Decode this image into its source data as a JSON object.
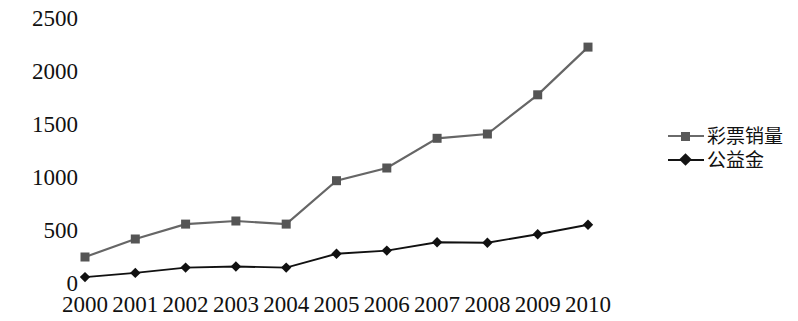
{
  "chart_data": {
    "type": "line",
    "title": "",
    "subtitle": "",
    "xlabel": "",
    "ylabel": "",
    "grid": false,
    "legend_position": "right",
    "categories": [
      "2000",
      "2001",
      "2002",
      "2003",
      "2004",
      "2005",
      "2006",
      "2007",
      "2008",
      "2009",
      "2010"
    ],
    "ylim": [
      0,
      2500
    ],
    "yticks": [
      0,
      500,
      1000,
      1500,
      2000,
      2500
    ],
    "ytick_labels": [
      "0",
      "500",
      "1000",
      "1500",
      "2000",
      "2500"
    ],
    "series": [
      {
        "name": "彩票销量",
        "marker": "square",
        "color": "#555555",
        "line_color": "#666666",
        "values": [
          250,
          420,
          560,
          590,
          560,
          970,
          1090,
          1370,
          1410,
          1780,
          2230
        ]
      },
      {
        "name": "公益金",
        "marker": "diamond",
        "color": "#111111",
        "line_color": "#111111",
        "values": [
          60,
          100,
          150,
          160,
          150,
          280,
          310,
          390,
          385,
          465,
          555
        ]
      }
    ]
  },
  "legend": {
    "items": [
      {
        "label": "彩票销量",
        "marker": "square"
      },
      {
        "label": "公益金",
        "marker": "diamond"
      }
    ]
  },
  "colors": {
    "series1": "#5a5a5a",
    "series2": "#141414",
    "text": "#111111",
    "background": "#ffffff"
  }
}
